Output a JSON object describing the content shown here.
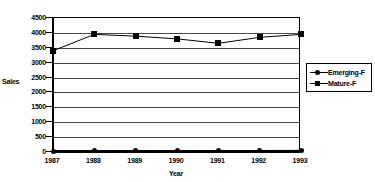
{
  "chart_data": {
    "type": "line",
    "title": "",
    "xlabel": "Year",
    "ylabel": "Sales",
    "categories": [
      "1987",
      "1988",
      "1989",
      "1990",
      "1991",
      "1992",
      "1993"
    ],
    "x": [
      1987,
      1988,
      1989,
      1990,
      1991,
      1992,
      1993
    ],
    "ylim": [
      0,
      4500
    ],
    "ytick_values": [
      0,
      500,
      1000,
      1500,
      2000,
      2500,
      3000,
      3500,
      4000,
      4500
    ],
    "ytick_labels": [
      "0",
      "500",
      "1000",
      "1500",
      "2000",
      "2500",
      "3000",
      "3500",
      "4000",
      "4500"
    ],
    "grid": true,
    "legend_position": "right",
    "series": [
      {
        "name": "Emerging-F",
        "marker": "circle",
        "color": "#000000",
        "values": [
          20,
          40,
          45,
          50,
          45,
          50,
          55
        ]
      },
      {
        "name": "Mature-F",
        "marker": "square",
        "color": "#000000",
        "values": [
          3400,
          3950,
          3890,
          3800,
          3650,
          3850,
          3950
        ]
      }
    ]
  },
  "legend": {
    "entries": [
      {
        "label": "Emerging-F",
        "marker": "circle"
      },
      {
        "label": "Mature-F",
        "marker": "square"
      }
    ]
  },
  "colors": {
    "axis": "#000000",
    "grid": "#4a4a4a",
    "series": "#000000",
    "background": "#ffffff"
  }
}
